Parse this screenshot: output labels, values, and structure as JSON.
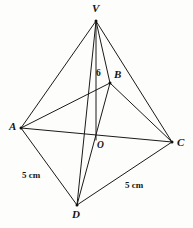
{
  "figure": {
    "canvas": {
      "width": 193,
      "height": 228
    },
    "stroke_color": "#1a1a1a",
    "background_color": "#fdfdfb",
    "vertices": [
      {
        "id": "V",
        "label": "V",
        "x": 96,
        "y": 21,
        "label_x": 92,
        "label_y": 3
      },
      {
        "id": "B",
        "label": "B",
        "x": 110,
        "y": 83,
        "label_x": 114,
        "label_y": 69
      },
      {
        "id": "A",
        "label": "A",
        "x": 21,
        "y": 128,
        "label_x": 9,
        "label_y": 121
      },
      {
        "id": "C",
        "label": "C",
        "x": 172,
        "y": 142,
        "label_x": 177,
        "label_y": 137
      },
      {
        "id": "D",
        "label": "D",
        "x": 77,
        "y": 205,
        "label_x": 72,
        "label_y": 209
      },
      {
        "id": "O",
        "label": "O",
        "x": 96,
        "y": 140,
        "label_x": 97,
        "label_y": 141
      }
    ],
    "edges": [
      {
        "from": "V",
        "to": "A",
        "width": 1.0
      },
      {
        "from": "V",
        "to": "B",
        "width": 1.0
      },
      {
        "from": "V",
        "to": "C",
        "width": 1.0
      },
      {
        "from": "V",
        "to": "D",
        "width": 1.0
      },
      {
        "from": "V",
        "to": "O",
        "width": 1.0
      },
      {
        "from": "A",
        "to": "B",
        "width": 1.0
      },
      {
        "from": "B",
        "to": "C",
        "width": 1.0
      },
      {
        "from": "A",
        "to": "C",
        "width": 1.0
      },
      {
        "from": "A",
        "to": "D",
        "width": 1.0
      },
      {
        "from": "D",
        "to": "C",
        "width": 1.0
      },
      {
        "from": "D",
        "to": "B",
        "width": 1.0
      }
    ],
    "measurements": [
      {
        "id": "height-6",
        "text": "6",
        "x": 96,
        "y": 69,
        "kind": "height"
      },
      {
        "id": "edge-ad-5cm",
        "text": "5 cm",
        "x": 22,
        "y": 171,
        "kind": "edge"
      },
      {
        "id": "edge-dc-5cm",
        "text": "5 cm",
        "x": 125,
        "y": 181,
        "kind": "edge"
      }
    ]
  }
}
